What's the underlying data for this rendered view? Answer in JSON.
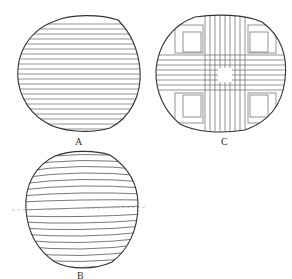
{
  "figure": {
    "panels": [
      {
        "id": "A",
        "label": "A",
        "pattern": "horizontal-parallel-lines"
      },
      {
        "id": "C",
        "label": "C",
        "pattern": "cross-quadrant-lines"
      },
      {
        "id": "B",
        "label": "B",
        "pattern": "curved-horizontal-lines"
      }
    ]
  },
  "colors": {
    "stroke": "#333333",
    "hatch": "#555555",
    "background": "#ffffff"
  }
}
